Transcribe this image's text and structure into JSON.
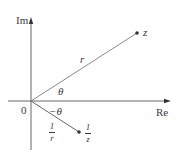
{
  "diagram": {
    "type": "complex-plane",
    "axes": {
      "x_label": "Re",
      "y_label": "Im",
      "origin_label": "0"
    },
    "points": [
      {
        "name": "z",
        "label": "z"
      },
      {
        "name": "reciprocal",
        "label_num": "1",
        "label_den": "z"
      }
    ],
    "segments": [
      {
        "name": "modulus",
        "label": "r"
      },
      {
        "name": "reciprocal-modulus",
        "label_num": "1",
        "label_den": "r"
      }
    ],
    "angles": [
      {
        "name": "theta",
        "label": "θ"
      },
      {
        "name": "neg-theta",
        "label": "−θ"
      }
    ],
    "colors": {
      "axis": "#4a4a4a",
      "line": "#8a8a8a",
      "point": "#3a3a3a"
    }
  }
}
